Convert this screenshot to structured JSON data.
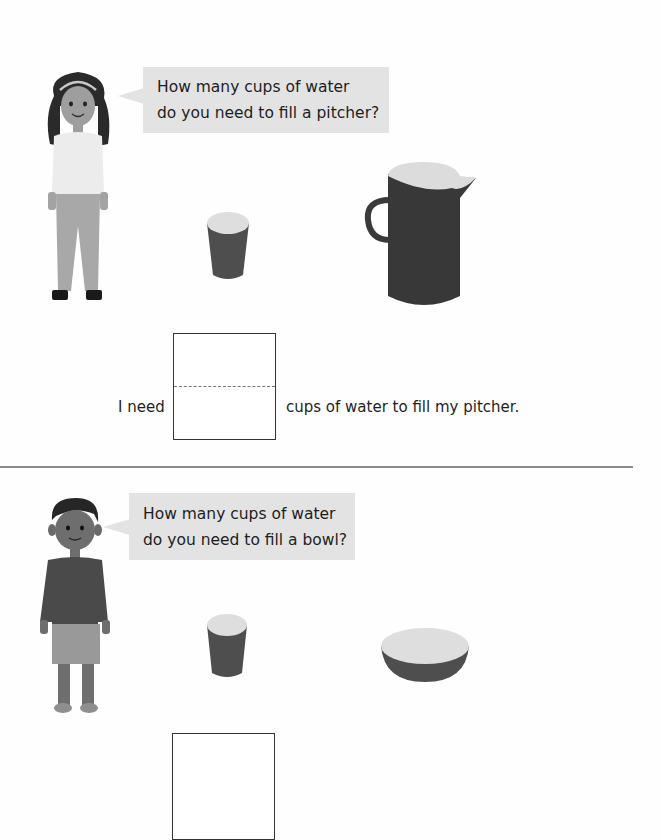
{
  "problems": [
    {
      "character": "girl",
      "question_lines": [
        "How many cups of water",
        "do you need to fill a pitcher?"
      ],
      "items": [
        "cup",
        "pitcher"
      ],
      "answer_prefix": "I need",
      "answer_value": "",
      "answer_suffix": "cups of water to fill my pitcher."
    },
    {
      "character": "boy",
      "question_lines": [
        "How many cups of water",
        "do you need to fill a bowl?"
      ],
      "items": [
        "cup",
        "bowl"
      ],
      "answer_value": ""
    }
  ],
  "colors": {
    "bubble": "#e3e3e3",
    "vessel_body": "#4a4a4a",
    "vessel_top": "#dcdcdc",
    "divider": "#8a8a8a"
  }
}
